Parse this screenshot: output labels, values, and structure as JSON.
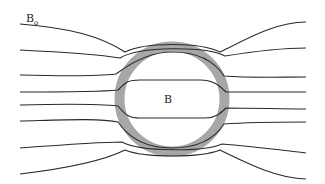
{
  "diagram": {
    "labels": {
      "external_field": "B",
      "external_field_subscript": "o",
      "internal_field": "B"
    },
    "shell": {
      "cx": 172,
      "cy": 99,
      "outer_r": 57,
      "inner_r": 48,
      "color": "#a7a7a7"
    },
    "line_color": "#2a2a2a",
    "field_lines": [
      {
        "name": "line-1",
        "d": "M20,24 C70,28 100,36 125,52 C145,42 200,42 220,52 C245,40 275,22 306,22"
      },
      {
        "name": "line-2",
        "d": "M20,50 C60,52 95,54 120,58 C140,46 205,46 225,56 C250,52 280,48 306,48"
      },
      {
        "name": "line-3",
        "d": "M20,75 C60,76 100,76 116,74 C132,62 150,52 172,52 C200,52 215,62 224,76 C250,78 280,77 306,77"
      },
      {
        "name": "line-4",
        "d": "M20,92 C60,92 100,92 118,90 C126,82 128,80 140,80 L200,80 C212,80 218,84 226,92 C255,92 280,92 306,92"
      },
      {
        "name": "line-5",
        "d": "M20,105 C60,104 100,104 118,106 C126,116 130,118 140,118 L205,118 C215,118 220,114 226,108 C255,108 280,109 306,109"
      },
      {
        "name": "line-6",
        "d": "M20,121 C60,120 100,118 118,122 C130,140 150,148 172,148 C200,148 215,138 224,124 C250,122 280,122 306,122"
      },
      {
        "name": "line-7",
        "d": "M20,148 C60,145 100,142 122,142 C140,152 205,152 222,144 C250,146 280,150 306,153"
      },
      {
        "name": "line-8",
        "d": "M20,174 C70,168 105,160 125,150 C145,158 200,158 220,150 C245,162 275,178 306,179"
      }
    ]
  }
}
